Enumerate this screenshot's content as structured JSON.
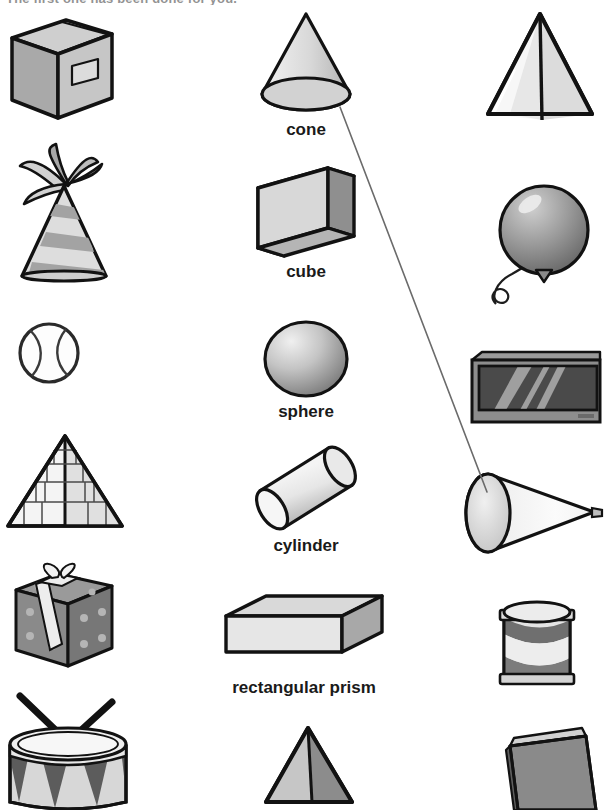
{
  "worksheet": {
    "instruction": "The first one has been done for you.",
    "page_width": 604,
    "page_height": 810,
    "background": "#ffffff",
    "ink": "#1a1a1a"
  },
  "shape_column": {
    "label_color": "#1a1a1a",
    "items": [
      {
        "name": "cone",
        "label": "cone",
        "x": 246,
        "y": 10,
        "w": 120,
        "h": 108,
        "caption_y": 110
      },
      {
        "name": "cube",
        "label": "cube",
        "x": 252,
        "y": 162,
        "w": 108,
        "h": 100,
        "caption_y": 100
      },
      {
        "name": "sphere",
        "label": "sphere",
        "x": 258,
        "y": 318,
        "w": 96,
        "h": 82,
        "caption_y": 84
      },
      {
        "name": "cylinder",
        "label": "cylinder",
        "x": 248,
        "y": 442,
        "w": 116,
        "h": 92,
        "caption_y": 94
      },
      {
        "name": "rectangular-prism",
        "label": "rectangular prism",
        "x": 218,
        "y": 592,
        "w": 172,
        "h": 84,
        "caption_y": 86
      },
      {
        "name": "pyramid",
        "label": "",
        "x": 262,
        "y": 722,
        "w": 96,
        "h": 88,
        "caption_y": 90
      }
    ]
  },
  "left_objects": {
    "items": [
      {
        "name": "cardboard-box",
        "alt": "cardboard box",
        "x": 6,
        "y": 14,
        "w": 112,
        "h": 112
      },
      {
        "name": "party-hat",
        "alt": "party hat",
        "x": 6,
        "y": 142,
        "w": 116,
        "h": 150
      },
      {
        "name": "tennis-ball",
        "alt": "tennis ball",
        "x": 14,
        "y": 318,
        "w": 70,
        "h": 70
      },
      {
        "name": "stone-pyramid",
        "alt": "stone pyramid",
        "x": 2,
        "y": 430,
        "w": 126,
        "h": 112
      },
      {
        "name": "gift-box",
        "alt": "wrapped gift box",
        "x": 8,
        "y": 560,
        "w": 112,
        "h": 114
      },
      {
        "name": "drum",
        "alt": "drum with drumsticks",
        "x": 2,
        "y": 690,
        "w": 132,
        "h": 120
      }
    ]
  },
  "right_objects": {
    "items": [
      {
        "name": "pyramid-tent",
        "alt": "pyramid tent",
        "x": 482,
        "y": 8,
        "w": 116,
        "h": 118
      },
      {
        "name": "balloon",
        "alt": "balloon",
        "x": 482,
        "y": 178,
        "w": 110,
        "h": 132
      },
      {
        "name": "television",
        "alt": "television screen",
        "x": 466,
        "y": 348,
        "w": 134,
        "h": 78
      },
      {
        "name": "megaphone-cone",
        "alt": "cone shaped megaphone",
        "x": 466,
        "y": 460,
        "w": 136,
        "h": 104
      },
      {
        "name": "tin-can",
        "alt": "tin can",
        "x": 494,
        "y": 596,
        "w": 86,
        "h": 100
      },
      {
        "name": "book",
        "alt": "book",
        "x": 506,
        "y": 724,
        "w": 94,
        "h": 86
      }
    ]
  },
  "match_line": {
    "name": "cone-to-megaphone-line",
    "from_shape": "cone",
    "to_object": "megaphone-cone",
    "x1": 340,
    "y1": 107,
    "x2": 487,
    "y2": 492,
    "color": "#6b6b6b",
    "width": 1.6
  },
  "palette": {
    "outline": "#121212",
    "light_fill": "#e4e4e4",
    "mid_fill": "#b9b9b9",
    "dark_fill": "#8e8e8e",
    "deep_fill": "#6e6e6e",
    "screen_fill": "#4a4a4a",
    "paper": "#ffffff"
  }
}
